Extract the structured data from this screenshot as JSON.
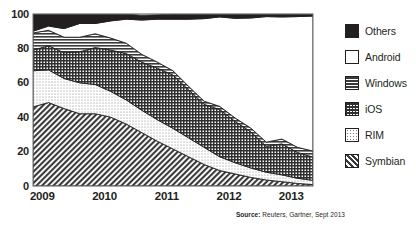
{
  "chart_data": {
    "type": "area",
    "stacked": true,
    "title": "",
    "subtitle": "",
    "xlabel": "",
    "ylabel": "",
    "ylim": [
      0,
      100
    ],
    "yticks": [
      0,
      20,
      40,
      60,
      80,
      100
    ],
    "ytick_labels": [
      "0",
      "20",
      "40",
      "60",
      "80",
      "100"
    ],
    "grid": "horizontal",
    "legend_position": "right",
    "source": {
      "label": "Source:",
      "text": " Reuters, Gartner, Sept 2013"
    },
    "x_tick_labels": [
      "2009",
      "2010",
      "2011",
      "2012",
      "2013"
    ],
    "x_tick_positions": [
      2009.0,
      2010.0,
      2011.0,
      2012.0,
      2013.0
    ],
    "x": [
      2008.85,
      2009.1,
      2009.35,
      2009.6,
      2009.85,
      2010.1,
      2010.35,
      2010.6,
      2010.85,
      2011.1,
      2011.35,
      2011.6,
      2011.85,
      2012.1,
      2012.35,
      2012.6,
      2012.85,
      2013.1,
      2013.35
    ],
    "series": [
      {
        "name": "Symbian",
        "pattern": "diagonal-hatch",
        "color": "#5a5a5a",
        "values": [
          46,
          48.5,
          45,
          42,
          42,
          40,
          36,
          31,
          26,
          21.5,
          17,
          12.5,
          9,
          7,
          5,
          3.5,
          2.5,
          1.5,
          0.8
        ]
      },
      {
        "name": "RIM",
        "pattern": "dots",
        "color": "#e8e8e8",
        "values": [
          21,
          19,
          17.5,
          18,
          17,
          15,
          14,
          13,
          12.5,
          12,
          11,
          10,
          8,
          6.5,
          5.5,
          4.5,
          4,
          3,
          2.5
        ]
      },
      {
        "name": "iOS",
        "pattern": "cross-hatch",
        "color": "#4a4a4a",
        "values": [
          12,
          14,
          15,
          18,
          21.5,
          24,
          27,
          28,
          30,
          31,
          28,
          25,
          27.5,
          24,
          21,
          15,
          18,
          15,
          13.5
        ]
      },
      {
        "name": "Windows",
        "pattern": "horizontal-lines",
        "color": "#7a7a7a",
        "values": [
          10,
          9,
          9,
          8.5,
          8,
          7,
          6,
          4.5,
          3.5,
          2.5,
          2,
          1.8,
          1.8,
          2,
          2.2,
          2.5,
          2.8,
          3,
          3.5
        ]
      },
      {
        "name": "Android",
        "pattern": "solid-white",
        "color": "#ffffff",
        "values": [
          1,
          2.5,
          5,
          8,
          6,
          10,
          14,
          20,
          25,
          30,
          39,
          48,
          52,
          58,
          64,
          73,
          71,
          76,
          78.5
        ]
      },
      {
        "name": "Others",
        "pattern": "solid-black",
        "color": "#231f20",
        "values": [
          10,
          7,
          8.5,
          5.5,
          5.5,
          4,
          3,
          2.7,
          2.5,
          3,
          3,
          2.7,
          1.7,
          2.5,
          2.3,
          1.5,
          1.7,
          1.5,
          1.2
        ]
      }
    ]
  },
  "legend": {
    "items": [
      {
        "label": "Others",
        "swatch": "solid-black"
      },
      {
        "label": "Android",
        "swatch": "solid-white"
      },
      {
        "label": "Windows",
        "swatch": "horizontal-lines"
      },
      {
        "label": "iOS",
        "swatch": "cross-hatch"
      },
      {
        "label": "RIM",
        "swatch": "dots"
      },
      {
        "label": "Symbian",
        "swatch": "diagonal-hatch"
      }
    ]
  },
  "colors": {
    "ink": "#231f20",
    "grid": "#b9b9b9",
    "axis": "#6d6d6d",
    "background": "#ffffff"
  }
}
